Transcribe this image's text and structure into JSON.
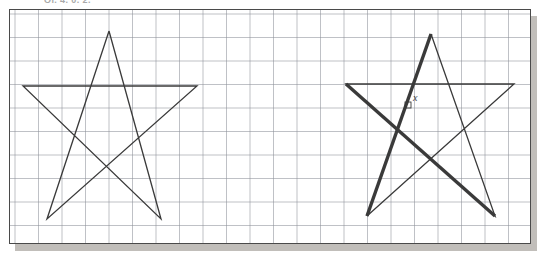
{
  "caption": {
    "text": "Ol. 4. 0. 2."
  },
  "figure": {
    "name": "two-pentagram-star-figures-on-graph-paper",
    "panel": {
      "x": 9,
      "y": 9,
      "width": 522,
      "height": 235,
      "border_color": "#4a4a4a",
      "background": "#ffffff",
      "shadow_color": "#b6b3ae",
      "shadow_offset": 6
    },
    "grid": {
      "cell_px": 23.5,
      "minor_color": "#c9ccd4",
      "major_color": "#8c9099",
      "minor_width": 0.7,
      "major_width": 1.0,
      "major_every": 1,
      "origin_x": 5,
      "origin_y": 4
    },
    "stroke_color": "#3a3a3a",
    "thin_width": 1.3,
    "bold_width": 3.4,
    "labels": [
      {
        "id": "x-label",
        "text": "x",
        "x": 412,
        "y": 92
      }
    ],
    "right_angle_marker": {
      "x": 404,
      "y": 101,
      "size": 6
    }
  },
  "chart_data": {
    "type": "diagram",
    "xlabel": "",
    "ylabel": "",
    "grid": true,
    "legend": "none",
    "shapes": [
      {
        "name": "left-star",
        "kind": "pentagram",
        "stroke": "thin",
        "vertices": [
          {
            "label": "top",
            "x": 108,
            "y": 30
          },
          {
            "label": "right-arm",
            "x": 196,
            "y": 85
          },
          {
            "label": "bottom-left",
            "x": 46,
            "y": 218
          },
          {
            "label": "left-arm",
            "x": 22,
            "y": 85
          },
          {
            "label": "bottom-right",
            "x": 160,
            "y": 218
          }
        ],
        "path_order": [
          "top",
          "bottom-left",
          "right-arm",
          "left-arm",
          "bottom-right",
          "top"
        ]
      },
      {
        "name": "right-star",
        "kind": "pentagram",
        "stroke": "thin",
        "vertices": [
          {
            "label": "top",
            "x": 430,
            "y": 33
          },
          {
            "label": "right-arm",
            "x": 513,
            "y": 83
          },
          {
            "label": "bottom-left",
            "x": 366,
            "y": 215
          },
          {
            "label": "left-arm",
            "x": 345,
            "y": 83
          },
          {
            "label": "bottom-right",
            "x": 494,
            "y": 215
          }
        ],
        "path_order": [
          "top",
          "bottom-left",
          "right-arm",
          "left-arm",
          "bottom-right",
          "top"
        ],
        "bold_segments": [
          {
            "from": "bottom-left",
            "to": "top"
          },
          {
            "from": "left-arm",
            "to": "bottom-right"
          }
        ]
      }
    ],
    "annotations": [
      {
        "text": "x",
        "x": 412,
        "y": 92,
        "describes": "angle between the two emphasised chords of the right star"
      },
      {
        "text": "right-angle-square",
        "x": 404,
        "y": 101,
        "describes": "small square marker on the emphasised chord"
      }
    ]
  }
}
